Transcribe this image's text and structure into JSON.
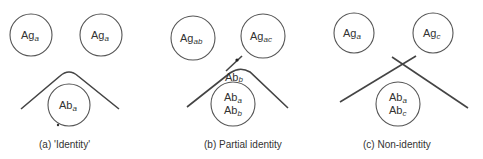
{
  "figure": {
    "panels": [
      {
        "caption": "(a) 'Identity'",
        "antigen_wells": [
          {
            "base": "Ag",
            "sub": "a"
          },
          {
            "base": "Ag",
            "sub": "a"
          }
        ],
        "antibody_well": [
          {
            "base": "Ab",
            "sub": "a"
          }
        ],
        "precipitin_pattern": "fused arc"
      },
      {
        "caption": "(b) Partial identity",
        "antigen_wells": [
          {
            "base": "Ag",
            "sub": "ab"
          },
          {
            "base": "Ag",
            "sub": "ac"
          }
        ],
        "antibody_well": [
          {
            "base": "Ab",
            "sub": "a"
          },
          {
            "base": "Ab",
            "sub": "b"
          }
        ],
        "spur_label": {
          "base": "Ab",
          "sub": "b"
        },
        "precipitin_pattern": "arc with spur"
      },
      {
        "caption": "(c) Non-identity",
        "antigen_wells": [
          {
            "base": "Ag",
            "sub": "a"
          },
          {
            "base": "Ag",
            "sub": "c"
          }
        ],
        "antibody_well": [
          {
            "base": "Ab",
            "sub": "a"
          },
          {
            "base": "Ab",
            "sub": "c"
          }
        ],
        "precipitin_pattern": "crossed lines"
      }
    ]
  }
}
